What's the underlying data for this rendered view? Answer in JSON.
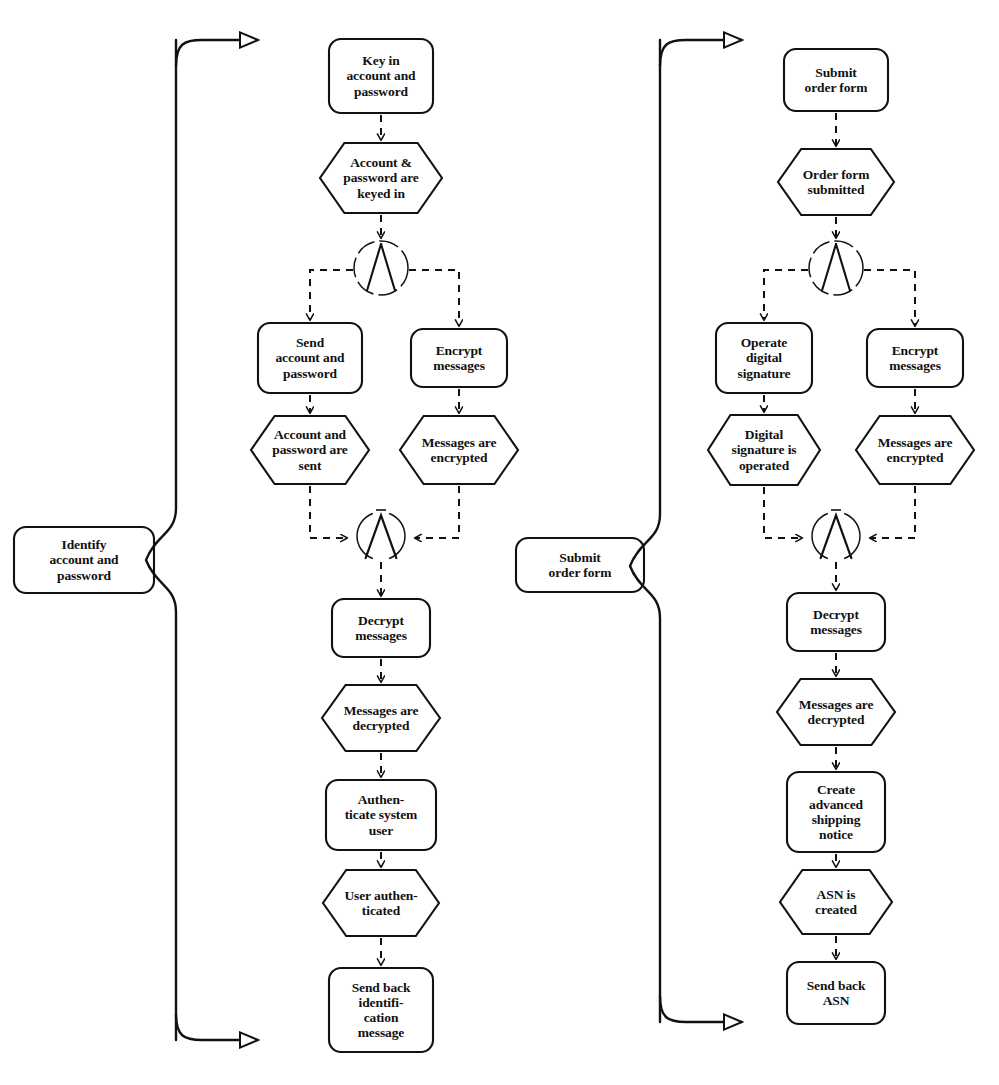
{
  "diagram": {
    "type": "event-driven-process-chain",
    "title": "",
    "background": "#ffffff",
    "stroke": "#111111",
    "lanes": [
      {
        "id": "lane-identify",
        "label": "Identify\naccount and\npassword",
        "x": 14,
        "y": 527,
        "w": 140,
        "h": 66,
        "brace_x": 176,
        "brace_top": 40,
        "brace_bottom": 1040,
        "brace_mid": 560,
        "arrow_top": {
          "x1": 176,
          "y1": 40,
          "x2": 262,
          "y2": 40
        },
        "arrow_bottom": {
          "x1": 176,
          "y1": 1040,
          "x2": 262,
          "y2": 1040
        }
      },
      {
        "id": "lane-submit",
        "label": "Submit\norder form",
        "x": 516,
        "y": 538,
        "w": 128,
        "h": 54,
        "brace_x": 660,
        "brace_top": 40,
        "brace_bottom": 1022,
        "brace_mid": 566,
        "arrow_top": {
          "x1": 660,
          "y1": 40,
          "x2": 746,
          "y2": 40
        },
        "arrow_bottom": {
          "x1": 660,
          "y1": 1022,
          "x2": 746,
          "y2": 1022
        }
      }
    ],
    "chains": [
      {
        "id": "chain-left",
        "name": "Identify account and password",
        "nodes": [
          {
            "id": "l1",
            "kind": "function",
            "label": "Key in\naccount and\npassword",
            "cx": 381,
            "cy": 76,
            "w": 104,
            "h": 74
          },
          {
            "id": "l2",
            "kind": "event",
            "label": "Account &\npassword are\nkeyed in",
            "cx": 381,
            "cy": 178,
            "w": 122,
            "h": 70
          },
          {
            "id": "l3",
            "kind": "connector-and-split",
            "label": "AND",
            "cx": 381,
            "cy": 268,
            "r": 27
          },
          {
            "id": "l4",
            "kind": "function",
            "label": "Send\naccount and\npassword",
            "cx": 310,
            "cy": 358,
            "w": 104,
            "h": 70
          },
          {
            "id": "l5",
            "kind": "function",
            "label": "Encrypt\nmessages",
            "cx": 459,
            "cy": 358,
            "w": 96,
            "h": 58
          },
          {
            "id": "l6",
            "kind": "event",
            "label": "Account and\npassword are\nsent",
            "cx": 310,
            "cy": 450,
            "w": 118,
            "h": 68
          },
          {
            "id": "l7",
            "kind": "event",
            "label": "Messages are\nencrypted",
            "cx": 459,
            "cy": 450,
            "w": 118,
            "h": 68
          },
          {
            "id": "l8",
            "kind": "connector-and-join",
            "label": "AND",
            "cx": 381,
            "cy": 536,
            "r": 24
          },
          {
            "id": "l9",
            "kind": "function",
            "label": "Decrypt\nmessages",
            "cx": 381,
            "cy": 628,
            "w": 98,
            "h": 58
          },
          {
            "id": "l10",
            "kind": "event",
            "label": "Messages are\ndecrypted",
            "cx": 381,
            "cy": 718,
            "w": 118,
            "h": 66
          },
          {
            "id": "l11",
            "kind": "function",
            "label": "Authen-\nticate system\nuser",
            "cx": 381,
            "cy": 815,
            "w": 110,
            "h": 70
          },
          {
            "id": "l12",
            "kind": "event",
            "label": "User authen-\nticated",
            "cx": 381,
            "cy": 903,
            "w": 116,
            "h": 66
          },
          {
            "id": "l13",
            "kind": "function",
            "label": "Send back\nidentifi-\ncation\nmessage",
            "cx": 381,
            "cy": 1010,
            "w": 104,
            "h": 84
          }
        ]
      },
      {
        "id": "chain-right",
        "name": "Submit order form",
        "nodes": [
          {
            "id": "r1",
            "kind": "function",
            "label": "Submit\norder form",
            "cx": 836,
            "cy": 80,
            "w": 104,
            "h": 62
          },
          {
            "id": "r2",
            "kind": "event",
            "label": "Order form\nsubmitted",
            "cx": 836,
            "cy": 182,
            "w": 116,
            "h": 66
          },
          {
            "id": "r3",
            "kind": "connector-and-split",
            "label": "AND",
            "cx": 836,
            "cy": 268,
            "r": 27
          },
          {
            "id": "r4",
            "kind": "function",
            "label": "Operate\ndigital\nsignature",
            "cx": 764,
            "cy": 358,
            "w": 96,
            "h": 70
          },
          {
            "id": "r5",
            "kind": "function",
            "label": "Encrypt\nmessages",
            "cx": 915,
            "cy": 358,
            "w": 96,
            "h": 58
          },
          {
            "id": "r6",
            "kind": "event",
            "label": "Digital\nsignature is\noperated",
            "cx": 764,
            "cy": 450,
            "w": 112,
            "h": 70
          },
          {
            "id": "r7",
            "kind": "event",
            "label": "Messages are\nencrypted",
            "cx": 915,
            "cy": 450,
            "w": 118,
            "h": 68
          },
          {
            "id": "r8",
            "kind": "connector-and-join",
            "label": "AND",
            "cx": 836,
            "cy": 536,
            "r": 24
          },
          {
            "id": "r9",
            "kind": "function",
            "label": "Decrypt\nmessages",
            "cx": 836,
            "cy": 622,
            "w": 98,
            "h": 58
          },
          {
            "id": "r10",
            "kind": "event",
            "label": "Messages are\ndecrypted",
            "cx": 836,
            "cy": 712,
            "w": 118,
            "h": 66
          },
          {
            "id": "r11",
            "kind": "function",
            "label": "Create\nadvanced\nshipping\nnotice",
            "cx": 836,
            "cy": 812,
            "w": 98,
            "h": 80
          },
          {
            "id": "r12",
            "kind": "event",
            "label": "ASN is\ncreated",
            "cx": 836,
            "cy": 902,
            "w": 112,
            "h": 64
          },
          {
            "id": "r13",
            "kind": "function",
            "label": "Send back\nASN",
            "cx": 836,
            "cy": 993,
            "w": 98,
            "h": 62
          }
        ]
      }
    ],
    "legend_shapes": {
      "function": "rounded-rectangle",
      "event": "hexagon",
      "connector": "circle-with-and-symbol",
      "control_flow": "dashed-arrow",
      "lane_link": "solid-brace"
    }
  }
}
